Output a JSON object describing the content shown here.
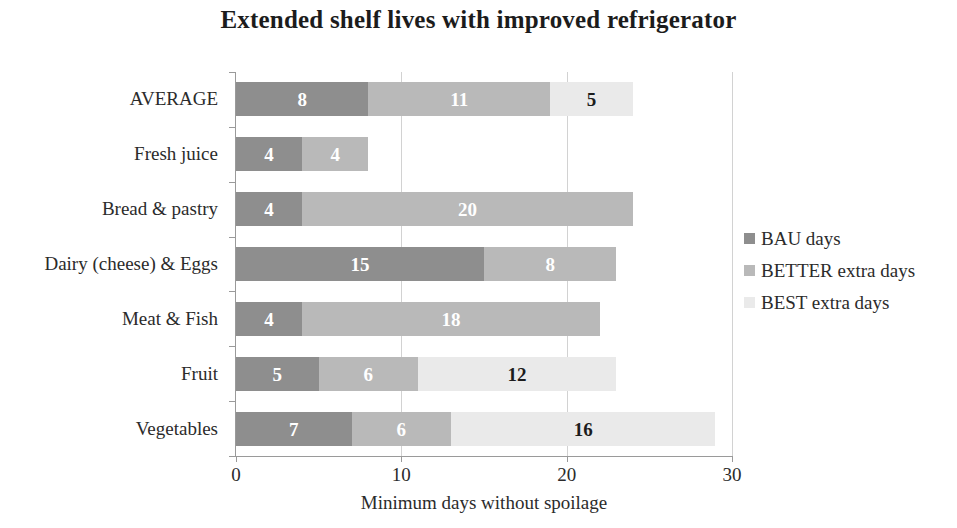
{
  "chart_data": {
    "type": "bar",
    "orientation": "horizontal",
    "stacked": true,
    "title": "Extended shelf lives with improved refrigerator",
    "xlabel": "Minimum days without spoilage",
    "ylabel": "",
    "xlim": [
      0,
      30
    ],
    "xticks": [
      0,
      10,
      20,
      30
    ],
    "xtick_labels": [
      "0",
      "10",
      "20",
      "30"
    ],
    "grid": "vertical",
    "legend_position": "right",
    "categories": [
      "AVERAGE",
      "Fresh juice",
      "Bread & pastry",
      "Dairy (cheese) & Eggs",
      "Meat & Fish",
      "Fruit",
      "Vegetables"
    ],
    "series": [
      {
        "name": "BAU days",
        "color": "#8e8e8e",
        "values": [
          8,
          4,
          4,
          15,
          4,
          5,
          7
        ]
      },
      {
        "name": "BETTER extra days",
        "color": "#b9b9b9",
        "values": [
          11,
          4,
          20,
          8,
          18,
          6,
          6
        ]
      },
      {
        "name": "BEST extra days",
        "color": "#eaeaea",
        "values": [
          5,
          0,
          0,
          0,
          0,
          12,
          16
        ]
      }
    ],
    "totals": [
      24,
      8,
      24,
      23,
      22,
      23,
      29
    ],
    "bar_labels": [
      [
        "8",
        "11",
        "5"
      ],
      [
        "4",
        "4",
        ""
      ],
      [
        "4",
        "20",
        ""
      ],
      [
        "15",
        "8",
        ""
      ],
      [
        "4",
        "18",
        ""
      ],
      [
        "5",
        "6",
        "12"
      ],
      [
        "7",
        "6",
        "16"
      ]
    ]
  },
  "legend": {
    "items": [
      {
        "label": "BAU days",
        "color": "#8e8e8e"
      },
      {
        "label": "BETTER extra days",
        "color": "#b9b9b9"
      },
      {
        "label": "BEST extra days",
        "color": "#eaeaea"
      }
    ]
  }
}
